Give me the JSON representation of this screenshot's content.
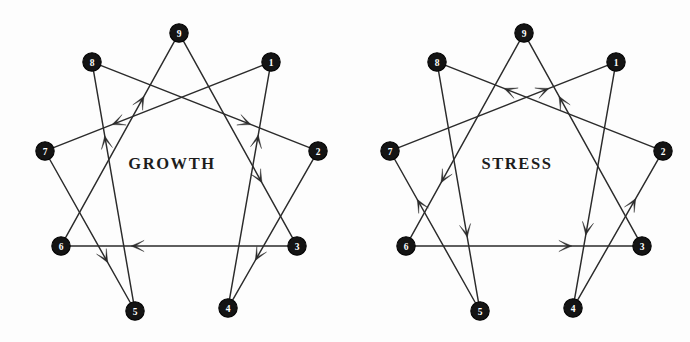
{
  "figure": {
    "type": "diagram",
    "panel_count": 2,
    "background_color": "#fdfdfd",
    "line_color": "#2b2b2b",
    "node_fill_color": "#141414",
    "node_text_color": "#ffffff"
  },
  "panels": [
    {
      "id": "growth",
      "center_label": "GROWTH",
      "nodes": [
        {
          "id": "9",
          "label": "9",
          "cx": 179,
          "cy": 33
        },
        {
          "id": "1",
          "label": "1",
          "cx": 271,
          "cy": 62
        },
        {
          "id": "2",
          "label": "2",
          "cx": 318,
          "cy": 151
        },
        {
          "id": "3",
          "label": "3",
          "cx": 297,
          "cy": 246
        },
        {
          "id": "4",
          "label": "4",
          "cx": 228,
          "cy": 308
        },
        {
          "id": "5",
          "label": "5",
          "cx": 135,
          "cy": 311
        },
        {
          "id": "6",
          "label": "6",
          "cx": 61,
          "cy": 246
        },
        {
          "id": "7",
          "label": "7",
          "cx": 45,
          "cy": 151
        },
        {
          "id": "8",
          "label": "8",
          "cx": 92,
          "cy": 62
        }
      ],
      "arrows": [
        {
          "from": "1",
          "to": "7"
        },
        {
          "from": "7",
          "to": "5"
        },
        {
          "from": "5",
          "to": "8"
        },
        {
          "from": "8",
          "to": "2"
        },
        {
          "from": "2",
          "to": "4"
        },
        {
          "from": "4",
          "to": "1"
        },
        {
          "from": "9",
          "to": "3"
        },
        {
          "from": "3",
          "to": "6"
        },
        {
          "from": "6",
          "to": "9"
        }
      ]
    },
    {
      "id": "stress",
      "center_label": "STRESS",
      "nodes": [
        {
          "id": "9",
          "label": "9",
          "cx": 179,
          "cy": 33
        },
        {
          "id": "1",
          "label": "1",
          "cx": 271,
          "cy": 62
        },
        {
          "id": "2",
          "label": "2",
          "cx": 318,
          "cy": 151
        },
        {
          "id": "3",
          "label": "3",
          "cx": 297,
          "cy": 246
        },
        {
          "id": "4",
          "label": "4",
          "cx": 228,
          "cy": 308
        },
        {
          "id": "5",
          "label": "5",
          "cx": 135,
          "cy": 311
        },
        {
          "id": "6",
          "label": "6",
          "cx": 61,
          "cy": 246
        },
        {
          "id": "7",
          "label": "7",
          "cx": 45,
          "cy": 151
        },
        {
          "id": "8",
          "label": "8",
          "cx": 92,
          "cy": 62
        }
      ],
      "arrows": [
        {
          "from": "1",
          "to": "4"
        },
        {
          "from": "4",
          "to": "2"
        },
        {
          "from": "2",
          "to": "8"
        },
        {
          "from": "8",
          "to": "5"
        },
        {
          "from": "5",
          "to": "7"
        },
        {
          "from": "7",
          "to": "1"
        },
        {
          "from": "9",
          "to": "6"
        },
        {
          "from": "6",
          "to": "3"
        },
        {
          "from": "3",
          "to": "9"
        }
      ]
    }
  ]
}
